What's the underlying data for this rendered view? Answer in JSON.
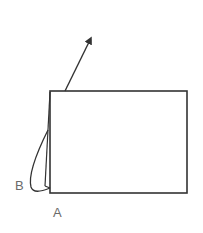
{
  "diagram": {
    "labels": {
      "a": "A",
      "b": "B"
    },
    "colors": {
      "stroke": "#333333",
      "label": "#6a6a6a",
      "background": "#ffffff"
    },
    "elements": [
      {
        "type": "rectangle",
        "name": "paper-sheet"
      },
      {
        "type": "arrow",
        "name": "lift-arrow"
      },
      {
        "type": "curved-flap",
        "name": "folded-flap"
      }
    ]
  }
}
